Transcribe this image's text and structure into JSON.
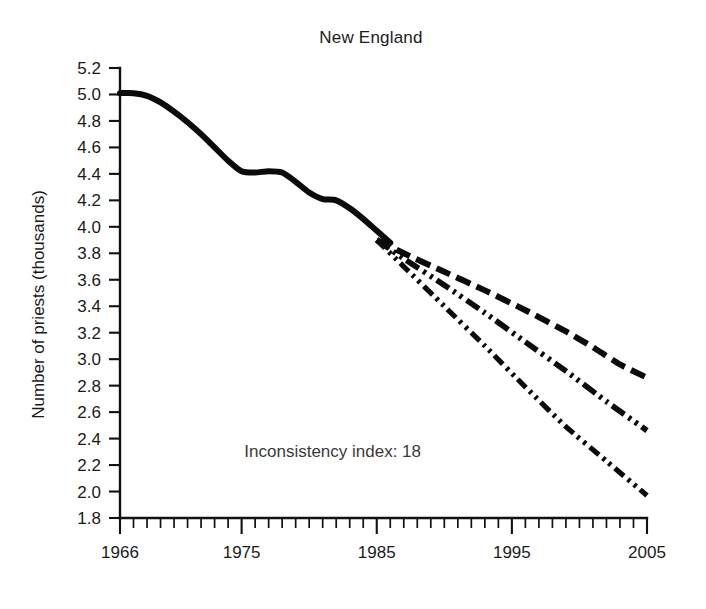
{
  "chart_data": {
    "type": "line",
    "title": "New England",
    "xlabel": "",
    "ylabel": "Number of priests (thousands)",
    "xlim": [
      1966,
      2005
    ],
    "ylim": [
      1.8,
      5.2
    ],
    "grid": false,
    "legend": "none",
    "x_tick_labels": [
      "1966",
      "1975",
      "1985",
      "1995",
      "2005"
    ],
    "x_tick_values": [
      1966,
      1975,
      1985,
      1995,
      2005
    ],
    "x_minor_tick_step": 1,
    "y_tick_labels": [
      "5.2",
      "5.0",
      "4.8",
      "4.6",
      "4.4",
      "4.2",
      "4.0",
      "3.8",
      "3.6",
      "3.4",
      "3.2",
      "3.0",
      "2.8",
      "2.6",
      "2.4",
      "2.2",
      "2.0",
      "1.8"
    ],
    "y_tick_values": [
      5.2,
      5.0,
      4.8,
      4.6,
      4.4,
      4.2,
      4.0,
      3.8,
      3.6,
      3.4,
      3.2,
      3.0,
      2.8,
      2.6,
      2.4,
      2.2,
      2.0,
      1.8
    ],
    "annotations": [
      {
        "name": "inconsistency-index",
        "text": "Inconsistency index: 18",
        "x": 1975.2,
        "y": 2.26
      }
    ],
    "series": [
      {
        "name": "Historical",
        "style": "solid",
        "x": [
          1966,
          1967,
          1968,
          1969,
          1970,
          1971,
          1972,
          1973,
          1974,
          1975,
          1976,
          1977,
          1978,
          1979,
          1980,
          1981,
          1982,
          1983,
          1984,
          1985,
          1986
        ],
        "values": [
          5.01,
          5.01,
          4.99,
          4.94,
          4.87,
          4.79,
          4.7,
          4.6,
          4.5,
          4.42,
          4.41,
          4.42,
          4.41,
          4.34,
          4.26,
          4.21,
          4.2,
          4.14,
          4.06,
          3.97,
          3.88
        ]
      },
      {
        "name": "High projection",
        "style": "dashed",
        "x": [
          1985,
          1987,
          1990,
          1993,
          1996,
          1999,
          2001,
          2003,
          2005
        ],
        "values": [
          3.9,
          3.8,
          3.66,
          3.52,
          3.37,
          3.21,
          3.09,
          2.96,
          2.86
        ]
      },
      {
        "name": "Middle projection",
        "style": "dash-dot-dot",
        "x": [
          1985,
          1987,
          1990,
          1993,
          1996,
          1999,
          2002,
          2005
        ],
        "values": [
          3.9,
          3.76,
          3.56,
          3.35,
          3.13,
          2.91,
          2.68,
          2.46
        ]
      },
      {
        "name": "Low projection",
        "style": "dash-dot",
        "x": [
          1985,
          1987,
          1990,
          1993,
          1996,
          1999,
          2002,
          2005
        ],
        "values": [
          3.9,
          3.7,
          3.4,
          3.1,
          2.79,
          2.49,
          2.23,
          1.97
        ]
      }
    ]
  }
}
